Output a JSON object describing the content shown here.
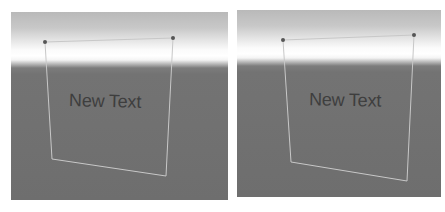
{
  "scene_views": [
    {
      "id": "left",
      "text_object": {
        "label": "New Text"
      },
      "colors": {
        "sky_top": "#b9b9b9",
        "horizon": "#ffffff",
        "ground": "#6e6e6e",
        "outline": "#c8c8c8",
        "handle": "#555555",
        "text": "#3e3e3e"
      }
    },
    {
      "id": "right",
      "text_object": {
        "label": "New Text"
      },
      "colors": {
        "sky_top": "#b9b9b9",
        "horizon": "#ffffff",
        "ground": "#6e6e6e",
        "outline": "#c8c8c8",
        "handle": "#555555",
        "text": "#3e3e3e"
      }
    }
  ]
}
